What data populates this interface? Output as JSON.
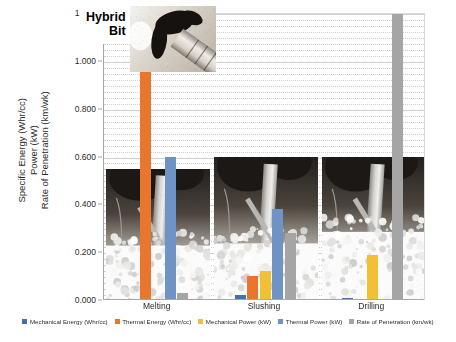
{
  "chart_data": {
    "type": "bar",
    "title": "",
    "annotation": "Hybrid\nBit",
    "xlabel": "",
    "ylabel": "Specific Energy (Whr/cc) Power (kW) Rate of Penetration (km/wk)",
    "ylabel_lines": [
      "Specific Energy (Whr/cc)",
      "Power (kW)",
      "Rate of Penetration (km/wk)"
    ],
    "ylim": [
      0,
      1.2
    ],
    "ytick_labels": [
      "0.000",
      "0.200",
      "0.400",
      "0.600",
      "0.800",
      "1.000",
      "1.200"
    ],
    "ytick_values": [
      0,
      0.2,
      0.4,
      0.6,
      0.8,
      1.0,
      1.2
    ],
    "minor_grid_step": 0.025,
    "grid": true,
    "legend_position": "bottom",
    "categories": [
      "Melting",
      "Slushing",
      "Drilling"
    ],
    "series": [
      {
        "name": "Mechanical Energy (Whr/cc)",
        "color": "#4472a8",
        "values": [
          0.005,
          0.02,
          0.01
        ]
      },
      {
        "name": "Thermal Energy (Whr/cc)",
        "color": "#e8762c",
        "values": [
          1.01,
          0.1,
          0.0
        ]
      },
      {
        "name": "Mechanical Power (kW)",
        "color": "#f2c037",
        "values": [
          0.005,
          0.12,
          0.19
        ]
      },
      {
        "name": "Thermal Power (kW)",
        "color": "#6f93c4",
        "values": [
          0.6,
          0.38,
          0.0
        ]
      },
      {
        "name": "Rate of Penetration (km/wk)",
        "color": "#a5a5a5",
        "values": [
          0.03,
          0.28,
          1.25
        ]
      }
    ]
  },
  "photos": [
    {
      "name": "melting-ice-experiment-photo"
    },
    {
      "name": "slushing-ice-experiment-photo"
    },
    {
      "name": "drilling-ice-experiment-photo"
    },
    {
      "name": "hybrid-bit-photo"
    }
  ]
}
